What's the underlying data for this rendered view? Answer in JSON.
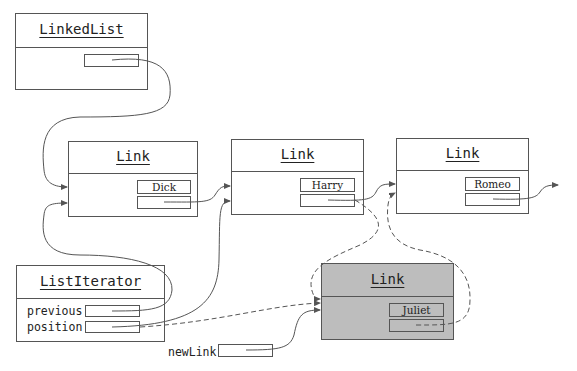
{
  "diagram": {
    "type": "linked-list-insertion",
    "linked_list": {
      "title": "LinkedList",
      "fields": [
        ""
      ]
    },
    "links": [
      {
        "title": "Link",
        "data": "Dick"
      },
      {
        "title": "Link",
        "data": "Harry"
      },
      {
        "title": "Link",
        "data": "Romeo"
      }
    ],
    "new_link": {
      "title": "Link",
      "data": "Juliet",
      "shaded": true
    },
    "list_iterator": {
      "title": "ListIterator",
      "fields": [
        {
          "label": "previous"
        },
        {
          "label": "position"
        }
      ]
    },
    "new_link_var": {
      "label": "newLink"
    },
    "edges": [
      {
        "from": "LinkedList.first",
        "to": "Link(Dick)",
        "style": "solid"
      },
      {
        "from": "Link(Dick).next",
        "to": "Link(Harry)",
        "style": "solid"
      },
      {
        "from": "Link(Harry).next",
        "to": "Link(Romeo)",
        "style": "solid"
      },
      {
        "from": "Link(Romeo).next",
        "to": "null/next",
        "style": "solid"
      },
      {
        "from": "ListIterator.previous",
        "to": "Link(Dick)",
        "style": "solid"
      },
      {
        "from": "ListIterator.position",
        "to": "Link(Harry)",
        "style": "solid"
      },
      {
        "from": "ListIterator.position",
        "to": "Link(Juliet)",
        "style": "dashed"
      },
      {
        "from": "Link(Harry).next",
        "to": "Link(Juliet)",
        "style": "dashed"
      },
      {
        "from": "Link(Juliet).next",
        "to": "Link(Romeo)",
        "style": "dashed"
      },
      {
        "from": "newLink",
        "to": "Link(Juliet)",
        "style": "solid"
      }
    ]
  }
}
